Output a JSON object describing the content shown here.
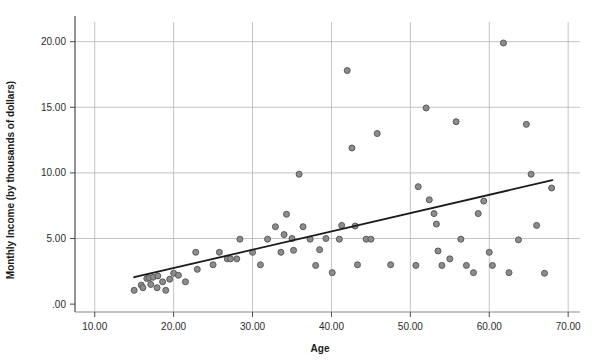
{
  "chart_data": {
    "type": "scatter",
    "title": "",
    "xlabel": "Age",
    "ylabel": "Monthly Income (by thousands of dollars)",
    "xlim": [
      7.5,
      71.5
    ],
    "ylim": [
      -0.6,
      21.5
    ],
    "xticks": [
      10,
      20,
      30,
      40,
      50,
      60,
      70
    ],
    "xticklabels": [
      "10.00",
      "20.00",
      "30.00",
      "40.00",
      "50.00",
      "60.00",
      "70.00"
    ],
    "yticks": [
      0,
      5,
      10,
      15,
      20
    ],
    "yticklabels": [
      ".00",
      "5.00",
      "10.00",
      "15.00",
      "20.00"
    ],
    "grid": "both",
    "grid_color": "#b5b5b5",
    "legend": "none",
    "marker": {
      "shape": "circle",
      "fill": "#8c8c8c",
      "edge": "#5a5a5a",
      "size": 6
    },
    "fit_line": {
      "label": "linear fit",
      "color": "#1a1a1a",
      "width": 1.8,
      "x_start": 15.0,
      "y_start": 2.05,
      "x_end": 68.0,
      "y_end": 9.45
    },
    "points": [
      {
        "x": 15.0,
        "y": 1.05
      },
      {
        "x": 15.9,
        "y": 1.45
      },
      {
        "x": 16.1,
        "y": 1.25
      },
      {
        "x": 16.6,
        "y": 1.95
      },
      {
        "x": 16.9,
        "y": 2.0
      },
      {
        "x": 17.1,
        "y": 1.5
      },
      {
        "x": 17.4,
        "y": 2.05
      },
      {
        "x": 17.9,
        "y": 1.25
      },
      {
        "x": 18.0,
        "y": 2.15
      },
      {
        "x": 18.6,
        "y": 1.7
      },
      {
        "x": 19.0,
        "y": 1.05
      },
      {
        "x": 19.5,
        "y": 1.9
      },
      {
        "x": 20.0,
        "y": 2.35
      },
      {
        "x": 20.6,
        "y": 2.2
      },
      {
        "x": 21.5,
        "y": 1.7
      },
      {
        "x": 22.8,
        "y": 3.95
      },
      {
        "x": 23.0,
        "y": 2.65
      },
      {
        "x": 25.0,
        "y": 3.0
      },
      {
        "x": 25.8,
        "y": 3.95
      },
      {
        "x": 26.8,
        "y": 3.45
      },
      {
        "x": 27.2,
        "y": 3.45
      },
      {
        "x": 28.0,
        "y": 3.45
      },
      {
        "x": 28.4,
        "y": 4.95
      },
      {
        "x": 30.0,
        "y": 3.95
      },
      {
        "x": 31.0,
        "y": 3.0
      },
      {
        "x": 31.9,
        "y": 4.95
      },
      {
        "x": 32.9,
        "y": 5.9
      },
      {
        "x": 33.6,
        "y": 3.95
      },
      {
        "x": 34.0,
        "y": 5.3
      },
      {
        "x": 34.3,
        "y": 6.85
      },
      {
        "x": 35.0,
        "y": 5.0
      },
      {
        "x": 35.2,
        "y": 4.1
      },
      {
        "x": 35.9,
        "y": 9.9
      },
      {
        "x": 36.4,
        "y": 5.9
      },
      {
        "x": 37.3,
        "y": 4.95
      },
      {
        "x": 38.0,
        "y": 2.95
      },
      {
        "x": 38.5,
        "y": 4.15
      },
      {
        "x": 39.3,
        "y": 5.0
      },
      {
        "x": 40.1,
        "y": 2.4
      },
      {
        "x": 41.0,
        "y": 4.95
      },
      {
        "x": 41.3,
        "y": 6.0
      },
      {
        "x": 42.0,
        "y": 17.8
      },
      {
        "x": 42.6,
        "y": 11.9
      },
      {
        "x": 43.0,
        "y": 5.95
      },
      {
        "x": 43.3,
        "y": 3.0
      },
      {
        "x": 44.4,
        "y": 4.95
      },
      {
        "x": 45.0,
        "y": 4.95
      },
      {
        "x": 45.8,
        "y": 13.0
      },
      {
        "x": 47.5,
        "y": 3.0
      },
      {
        "x": 50.7,
        "y": 2.95
      },
      {
        "x": 51.0,
        "y": 8.95
      },
      {
        "x": 52.0,
        "y": 14.95
      },
      {
        "x": 52.4,
        "y": 7.95
      },
      {
        "x": 53.0,
        "y": 6.9
      },
      {
        "x": 53.3,
        "y": 6.1
      },
      {
        "x": 53.5,
        "y": 4.05
      },
      {
        "x": 54.0,
        "y": 2.95
      },
      {
        "x": 55.0,
        "y": 3.45
      },
      {
        "x": 55.8,
        "y": 13.9
      },
      {
        "x": 56.4,
        "y": 4.95
      },
      {
        "x": 57.1,
        "y": 2.95
      },
      {
        "x": 58.0,
        "y": 2.4
      },
      {
        "x": 58.6,
        "y": 6.9
      },
      {
        "x": 59.3,
        "y": 7.85
      },
      {
        "x": 60.0,
        "y": 3.95
      },
      {
        "x": 60.4,
        "y": 2.95
      },
      {
        "x": 61.8,
        "y": 19.9
      },
      {
        "x": 62.5,
        "y": 2.4
      },
      {
        "x": 63.7,
        "y": 4.9
      },
      {
        "x": 64.7,
        "y": 13.7
      },
      {
        "x": 65.3,
        "y": 9.9
      },
      {
        "x": 66.0,
        "y": 6.0
      },
      {
        "x": 67.0,
        "y": 2.35
      },
      {
        "x": 67.9,
        "y": 8.85
      }
    ]
  }
}
